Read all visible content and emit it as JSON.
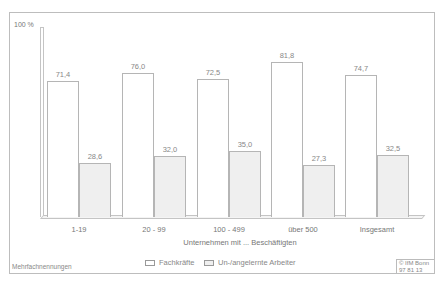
{
  "chart_data": {
    "type": "bar",
    "title": "",
    "ylabel": "100 %",
    "xlabel": "Unternehmen mit ... Beschäftigten",
    "ylim": [
      0,
      100
    ],
    "grid": false,
    "legend_position": "bottom",
    "categories": [
      "1-19",
      "20 - 99",
      "100 - 499",
      "über 500",
      "Insgesamt"
    ],
    "series": [
      {
        "name": "Fachkräfte",
        "style": "white",
        "values": [
          71.4,
          76.0,
          72.5,
          81.8,
          74.7
        ],
        "labels": [
          "71,4",
          "76,0",
          "72,5",
          "81,8",
          "74,7"
        ]
      },
      {
        "name": "Un-/angelernte Arbeiter",
        "style": "hatched",
        "values": [
          28.6,
          32.0,
          35.0,
          27.3,
          32.5
        ],
        "labels": [
          "28,6",
          "32,0",
          "35,0",
          "27,3",
          "32,5"
        ]
      }
    ],
    "annotations": [
      "Mehrfachnennungen"
    ]
  },
  "footer": {
    "note": "Mehrfachnennungen",
    "credit_line1": "© IfM Bonn",
    "credit_line2": "97  81  13"
  }
}
